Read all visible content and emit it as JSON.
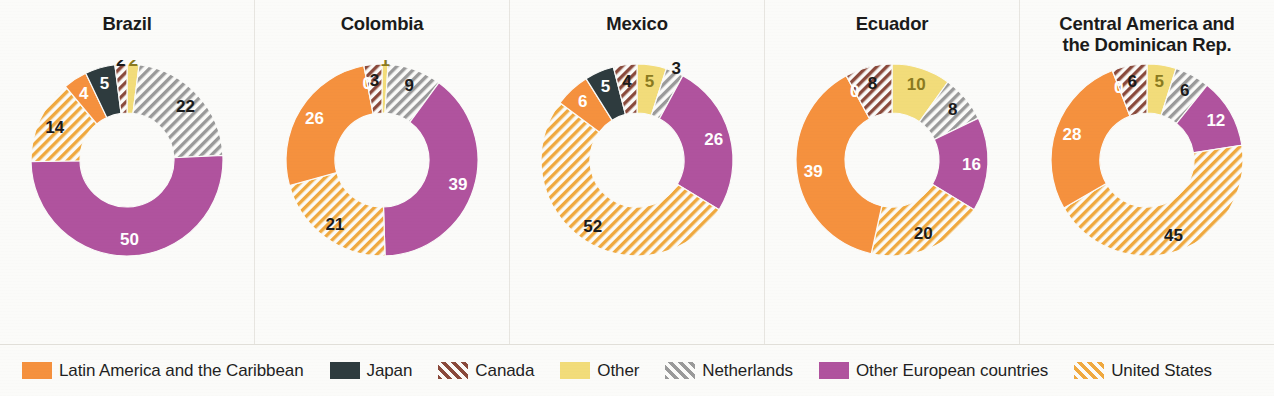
{
  "chart_data": {
    "type": "pie",
    "title": "",
    "subtitle": "",
    "chart_subtype": "donut",
    "legend_position": "bottom",
    "units": "percent",
    "categories": [
      "Latin America and the Caribbean",
      "Japan",
      "Canada",
      "Other",
      "Netherlands",
      "Other European countries",
      "United States"
    ],
    "category_styles": [
      {
        "name": "Latin America and the Caribbean",
        "fill": "#F5913E",
        "pattern": "solid"
      },
      {
        "name": "Japan",
        "fill": "#2E3B3E",
        "pattern": "solid"
      },
      {
        "name": "Canada",
        "fill": "#8A4A3C",
        "pattern": "diagonal-stripes"
      },
      {
        "name": "Other",
        "fill": "#F2DC7A",
        "pattern": "solid"
      },
      {
        "name": "Netherlands",
        "fill": "#9A9A9A",
        "pattern": "diagonal-stripes"
      },
      {
        "name": "Other European countries",
        "fill": "#B0539E",
        "pattern": "solid"
      },
      {
        "name": "United States",
        "fill": "#F0A93F",
        "pattern": "diagonal-stripes"
      }
    ],
    "panels": [
      {
        "title": "Brazil",
        "slice_order": [
          "Other",
          "Netherlands",
          "Other European countries",
          "United States",
          "Latin America and the Caribbean",
          "Japan",
          "Canada"
        ],
        "values": {
          "Other": 2,
          "Netherlands": 22,
          "Other European countries": 50,
          "United States": 14,
          "Latin America and the Caribbean": 4,
          "Japan": 5,
          "Canada": 2
        },
        "labels": [
          "2",
          "22",
          "50",
          "14",
          "4",
          "5",
          "2"
        ]
      },
      {
        "title": "Colombia",
        "slice_order": [
          "Other",
          "Netherlands",
          "Other European countries",
          "United States",
          "Latin America and the Caribbean",
          "Japan",
          "Canada"
        ],
        "values": {
          "Other": 1,
          "Netherlands": 9,
          "Other European countries": 39,
          "United States": 21,
          "Latin America and the Caribbean": 26,
          "Japan": 0,
          "Canada": 3
        },
        "labels": [
          "1",
          "9",
          "39",
          "21",
          "26",
          "0",
          "3"
        ]
      },
      {
        "title": "Mexico",
        "slice_order": [
          "Other",
          "Netherlands",
          "Other European countries",
          "United States",
          "Latin America and the Caribbean",
          "Japan",
          "Canada"
        ],
        "values": {
          "Other": 5,
          "Netherlands": 3,
          "Other European countries": 26,
          "United States": 52,
          "Latin America and the Caribbean": 6,
          "Japan": 5,
          "Canada": 4
        },
        "labels": [
          "5",
          "3",
          "26",
          "52",
          "6",
          "5",
          "4"
        ]
      },
      {
        "title": "Ecuador",
        "slice_order": [
          "Other",
          "Netherlands",
          "Other European countries",
          "United States",
          "Latin America and the Caribbean",
          "Japan",
          "Canada"
        ],
        "values": {
          "Other": 10,
          "Netherlands": 8,
          "Other European countries": 16,
          "United States": 20,
          "Latin America and the Caribbean": 39,
          "Japan": 0,
          "Canada": 8
        },
        "labels": [
          "10",
          "8",
          "16",
          "20",
          "39",
          "0",
          "8"
        ]
      },
      {
        "title": "Central America and\nthe Dominican Rep.",
        "slice_order": [
          "Other",
          "Netherlands",
          "Other European countries",
          "United States",
          "Latin America and the Caribbean",
          "Japan",
          "Canada"
        ],
        "values": {
          "Other": 5,
          "Netherlands": 6,
          "Other European countries": 12,
          "United States": 45,
          "Latin America and the Caribbean": 28,
          "Japan": 0,
          "Canada": 6
        },
        "labels": [
          "5",
          "6",
          "12",
          "45",
          "28",
          "0",
          "6"
        ]
      }
    ]
  },
  "legend": {
    "items": [
      {
        "label": "Latin America and the Caribbean",
        "key": "Latin America and the Caribbean"
      },
      {
        "label": "Japan",
        "key": "Japan"
      },
      {
        "label": "Canada",
        "key": "Canada"
      },
      {
        "label": "Other",
        "key": "Other"
      },
      {
        "label": "Netherlands",
        "key": "Netherlands"
      },
      {
        "label": "Other European countries",
        "key": "Other European countries"
      },
      {
        "label": "United States",
        "key": "United States"
      }
    ]
  }
}
